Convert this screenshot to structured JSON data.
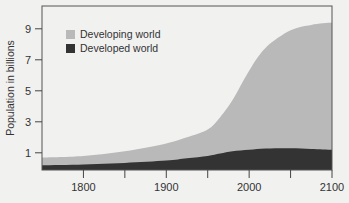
{
  "chart_data": {
    "type": "area",
    "stacked": true,
    "title": "",
    "xlabel": "",
    "ylabel": "Population in billions",
    "xlim": [
      1750,
      2100
    ],
    "ylim": [
      0,
      10
    ],
    "x_ticks": [
      1800,
      1850,
      1900,
      1950,
      2000,
      2050,
      2100
    ],
    "x_tick_labels": [
      "1800",
      "",
      "1900",
      "",
      "2000",
      "",
      "2100"
    ],
    "y_ticks": [
      1,
      3,
      5,
      7,
      9
    ],
    "y_tick_labels": [
      "1",
      "3",
      "5",
      "7",
      "9"
    ],
    "grid": false,
    "legend_position": "upper-left",
    "x": [
      1750,
      1800,
      1850,
      1900,
      1925,
      1950,
      1965,
      1980,
      2000,
      2020,
      2050,
      2075,
      2100
    ],
    "series": [
      {
        "name": "Developed world",
        "color": "#333333",
        "values": [
          0.2,
          0.25,
          0.35,
          0.5,
          0.65,
          0.8,
          0.95,
          1.1,
          1.2,
          1.28,
          1.3,
          1.25,
          1.2
        ]
      },
      {
        "name": "Developing world",
        "color": "#b9b9b9",
        "values": [
          0.5,
          0.55,
          0.75,
          1.1,
          1.35,
          1.7,
          2.35,
          3.3,
          5.1,
          6.5,
          7.6,
          8.0,
          8.2
        ]
      }
    ],
    "totals": [
      0.7,
      0.8,
      1.1,
      1.6,
      2.0,
      2.5,
      3.3,
      4.4,
      6.3,
      7.8,
      8.9,
      9.25,
      9.4
    ]
  },
  "legend": {
    "items": [
      {
        "label": "Developing world",
        "color": "#b9b9b9"
      },
      {
        "label": "Developed world",
        "color": "#333333"
      }
    ]
  },
  "axes": {
    "ylabel": "Population in billions"
  }
}
